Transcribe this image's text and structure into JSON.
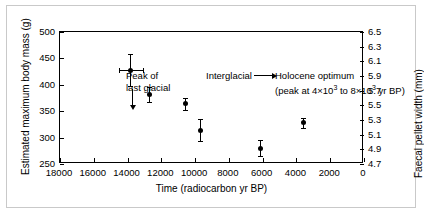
{
  "chart_data": {
    "type": "scatter",
    "title": "",
    "xlabel": "Time (radiocarbon yr BP)",
    "ylabel": "Estimated maximum body mass (g)",
    "y2label": "Faecal pellet width (mm)",
    "xlim": [
      18000,
      0
    ],
    "xlim_note": "x axis is reversed (older time on the left)",
    "ylim": [
      250,
      500
    ],
    "y2lim": [
      4.7,
      6.5
    ],
    "grid": false,
    "legend": "none",
    "xticks": [
      18000,
      16000,
      14000,
      12000,
      10000,
      8000,
      6000,
      4000,
      2000,
      0
    ],
    "xticklabels": [
      "18000",
      "16000",
      "14000",
      "12000",
      "10000",
      "8000",
      "6000",
      "4000",
      "2000",
      "0"
    ],
    "yticks": [
      250,
      300,
      350,
      400,
      450,
      500
    ],
    "yticklabels": [
      "250",
      "300",
      "350",
      "400",
      "450",
      "500"
    ],
    "y2ticks": [
      4.7,
      4.9,
      5.1,
      5.3,
      5.5,
      5.7,
      5.9,
      6.1,
      6.3,
      6.5
    ],
    "y2ticklabels": [
      "4.7",
      "4.9",
      "5.1",
      "5.3",
      "5.5",
      "5.7",
      "5.9",
      "6.1",
      "6.3",
      "6.5"
    ],
    "points": [
      {
        "x": 13800,
        "y": 428,
        "yerr": 30,
        "xerr": 700
      },
      {
        "x": 12700,
        "y": 381,
        "yerr": 14,
        "xerr": 0
      },
      {
        "x": 10550,
        "y": 364,
        "yerr": 11,
        "xerr": 0
      },
      {
        "x": 9700,
        "y": 314,
        "yerr": 21,
        "xerr": 0
      },
      {
        "x": 6100,
        "y": 280,
        "yerr": 15,
        "xerr": 0
      },
      {
        "x": 3600,
        "y": 328,
        "yerr": 10,
        "xerr": 0
      }
    ],
    "annotations": [
      {
        "name": "peak-of-last-glacial",
        "line1": "Peak of",
        "line2": "last glacial",
        "marker": "down-arrow"
      },
      {
        "name": "interglacial",
        "line1": "Interglacial",
        "line2": "",
        "marker": "right-arrow"
      },
      {
        "name": "holocene-optimum",
        "line1": "Holocene optimum",
        "line2": "(peak at 4×10³ to 8×10³ yr BP)",
        "marker": "none"
      }
    ]
  },
  "axes": {
    "x_title": "Time (radiocarbon yr BP)",
    "y_left_title": "Estimated maximum body mass (g)",
    "y_right_title": "Faecal pellet width (mm)"
  },
  "annotations": {
    "peak_line1": "Peak of",
    "peak_line2": "last glacial",
    "interglacial": "Interglacial",
    "holocene_line1": "Holocene optimum",
    "holocene_line2_a": "(peak at 4",
    "holocene_line2_x1": "×10",
    "holocene_line2_sup1": "3",
    "holocene_line2_b": " to 8",
    "holocene_line2_x2": "×10",
    "holocene_line2_sup2": "3",
    "holocene_line2_c": " yr BP)"
  },
  "colors": {
    "ink": "#000000",
    "background": "#ffffff",
    "border": "#c9c9c9"
  }
}
